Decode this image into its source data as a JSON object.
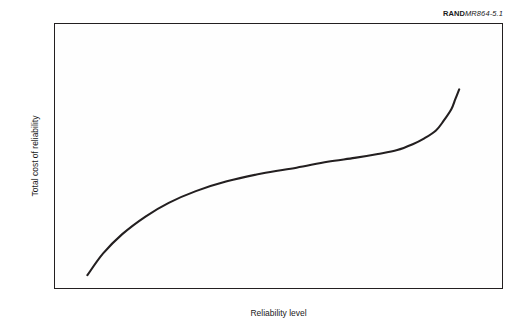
{
  "figure_tag": {
    "brand": "RAND",
    "number": "MR864-5.1"
  },
  "axes": {
    "x_title": "Reliability level",
    "y_title": "Total cost of reliability"
  },
  "style": {
    "curve_color": "#231f20",
    "frame_color": "#231f20",
    "plot_background": "#fefefe",
    "text_color": "#1a1a1a"
  },
  "chart_data": {
    "type": "line",
    "title": "",
    "subtitle": "",
    "xlabel": "Reliability level",
    "ylabel": "Total cost of reliability",
    "xlim": [
      0,
      100
    ],
    "ylim": [
      0,
      100
    ],
    "grid": false,
    "legend": null,
    "axis_ticks": {
      "x": [],
      "y": []
    },
    "annotations": [
      {
        "text": "RANDMR864-5.1",
        "position": "top-right-outside",
        "note": "RAND report figure identifier"
      }
    ],
    "series": [
      {
        "name": "Total cost of reliability",
        "color": "#231f20",
        "shape": "sigmoid / S-curve: steep rise at low reliability, long shallow middle plateau, sharp asymptotic rise approaching maximum reliability",
        "x": [
          4,
          8,
          13,
          19,
          25,
          32,
          40,
          49,
          58,
          66,
          73,
          79,
          84,
          88,
          91,
          94,
          96,
          98,
          99,
          100
        ],
        "y": [
          3,
          14,
          24,
          33,
          40,
          46,
          51,
          55,
          58,
          61,
          63,
          65,
          67,
          70,
          73,
          77,
          82,
          88,
          93,
          98
        ]
      }
    ]
  }
}
